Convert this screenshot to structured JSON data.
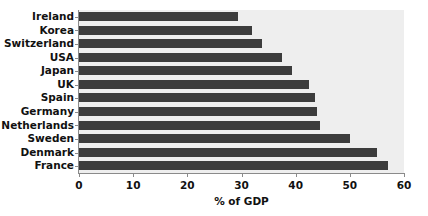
{
  "chart_data": {
    "type": "bar",
    "orientation": "horizontal",
    "title": "",
    "xlabel": "% of GDP",
    "ylabel": "",
    "categories": [
      "Ireland",
      "Korea",
      "Switzerland",
      "USA",
      "Japan",
      "UK",
      "Spain",
      "Germany",
      "Netherlands",
      "Sweden",
      "Denmark",
      "France"
    ],
    "values": [
      29.3,
      32,
      33.8,
      37.5,
      39.3,
      42.4,
      43.5,
      44,
      44.5,
      50,
      55,
      57
    ],
    "xlim": [
      0,
      60
    ],
    "xticks": [
      0,
      10,
      20,
      30,
      40,
      50,
      60
    ],
    "xtick_labels": [
      "0",
      "10",
      "20",
      "30",
      "40",
      "50",
      "60"
    ],
    "grid": false,
    "legend": "none",
    "bar_color": "#3c3c3c",
    "plot_background": "#eeeeee",
    "axis_color": "#8a8a8a"
  }
}
